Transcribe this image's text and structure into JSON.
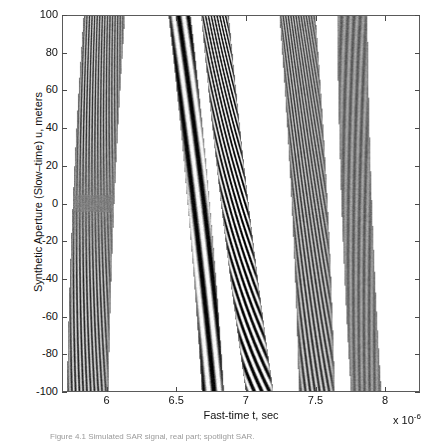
{
  "figure": {
    "title": "",
    "caption": "Figure 4.1   Simulated SAR signal, real part; spotlight SAR.",
    "background_color": "#ffffff",
    "frame_color": "#5a5a5a"
  },
  "axes": {
    "x": {
      "label": "Fast-time t, sec",
      "ticks": [
        "6",
        "6.5",
        "7",
        "7.5",
        "8"
      ],
      "tick_values": [
        6,
        6.5,
        7,
        7.5,
        8
      ],
      "limits": [
        5.68,
        8.25
      ],
      "exponent_prefix": "x 10",
      "exponent_power": "-6"
    },
    "y": {
      "label": "Synthetic Aperture (Slow–time) u, meters",
      "ticks": [
        "100",
        "80",
        "60",
        "40",
        "20",
        "0",
        "-20",
        "-40",
        "-60",
        "-80",
        "-100"
      ],
      "tick_values": [
        100,
        80,
        60,
        40,
        20,
        0,
        -20,
        -40,
        -60,
        -80,
        -100
      ],
      "limits": [
        -100,
        100
      ]
    }
  },
  "chart_data": {
    "type": "heatmap",
    "title": "",
    "xlabel": "Fast-time t, sec",
    "ylabel": "Synthetic Aperture (Slow–time) u, meters",
    "xlim": [
      5.68,
      8.25
    ],
    "ylim": [
      -100,
      100
    ],
    "x_exponent": -6,
    "grid": false,
    "legend": "none",
    "colormap": "gray",
    "value_range": [
      -1,
      1
    ],
    "targets": [
      {
        "id": 1,
        "t_center_us": 5.9,
        "u_center_m": 0,
        "drift_us_per_100m": 0.06,
        "band_width_us": 0.3,
        "fringe_period_us": 0.022,
        "fringe_tilt": 0.55,
        "contrast": 0.55,
        "envelope": "waist"
      },
      {
        "id": 2,
        "t_center_us": 6.66,
        "u_center_m": 10,
        "drift_us_per_100m": -0.12,
        "band_width_us": 0.16,
        "fringe_period_us": 0.075,
        "fringe_tilt": 0.1,
        "contrast": 1.0,
        "envelope": "flat"
      },
      {
        "id": 3,
        "t_center_us": 6.92,
        "u_center_m": 0,
        "drift_us_per_100m": -0.16,
        "band_width_us": 0.2,
        "fringe_period_us": 0.03,
        "fringe_tilt": 1.3,
        "contrast": 0.95,
        "envelope": "flat"
      },
      {
        "id": 4,
        "t_center_us": 7.46,
        "u_center_m": 0,
        "drift_us_per_100m": -0.07,
        "band_width_us": 0.26,
        "fringe_period_us": 0.024,
        "fringe_tilt": 0.85,
        "contrast": 0.6,
        "envelope": "flat"
      },
      {
        "id": 5,
        "t_center_us": 7.8,
        "u_center_m": 0,
        "drift_us_per_100m": -0.05,
        "band_width_us": 0.22,
        "fringe_period_us": 0.04,
        "fringe_tilt": -0.3,
        "contrast": 0.25,
        "envelope": "flat"
      }
    ]
  }
}
